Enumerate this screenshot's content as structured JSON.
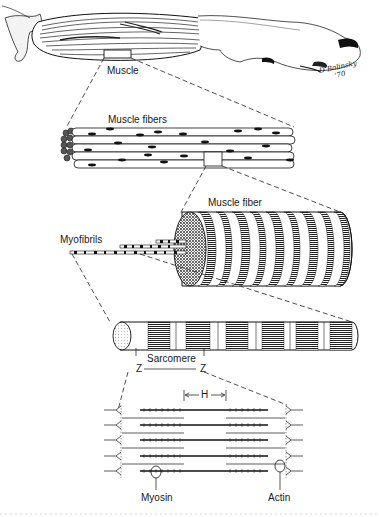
{
  "figure": {
    "levels": [
      {
        "id": "muscle",
        "label": "Muscle"
      },
      {
        "id": "muscle_fibers",
        "label": "Muscle fibers"
      },
      {
        "id": "muscle_fiber",
        "label": "Muscle fiber"
      },
      {
        "id": "myofibrils",
        "label": "Myofibrils"
      },
      {
        "id": "sarcomere",
        "label": "Sarcomere"
      }
    ],
    "sarcomere_labels": {
      "z_left": "Z",
      "z_right": "Z",
      "h_band": "H"
    },
    "filament_labels": {
      "myosin": "Myosin",
      "actin": "Actin"
    },
    "signature": {
      "name": "D Bolinsky",
      "year": "'70"
    }
  },
  "colors": {
    "ink": "#1a1a1a",
    "paper": "#ffffff",
    "shade": "#555555"
  }
}
